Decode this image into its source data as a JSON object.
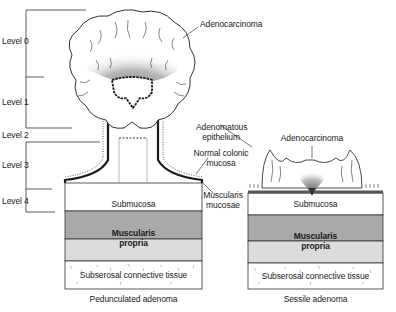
{
  "levels": [
    {
      "label": "Level 0"
    },
    {
      "label": "Level 1"
    },
    {
      "label": "Level 2"
    },
    {
      "label": "Level 3"
    },
    {
      "label": "Level 4"
    }
  ],
  "pedunculated": {
    "caption": "Pedunculated adenoma",
    "annotations": {
      "adenocarcinoma": "Adenocarcinoma",
      "adenomatous_epithelium": [
        "Adenomatous",
        "epithelium"
      ],
      "normal_colonic_mucosa": [
        "Normal colonic",
        "mucosa"
      ],
      "muscularis_mucosae": [
        "Muscularis",
        "mucosae"
      ]
    },
    "layers": {
      "submucosa": "Submucosa",
      "muscularis_propria": [
        "Muscularis",
        "propria"
      ],
      "subserosal": "Subserosal connective tissue"
    }
  },
  "sessile": {
    "caption": "Sessile adenoma",
    "annotations": {
      "adenocarcinoma": "Adenocarcinoma"
    },
    "layers": {
      "submucosa": "Submucosa",
      "muscularis_propria": [
        "Muscularis",
        "propria"
      ],
      "subserosal": "Subserosal connective tissue"
    }
  },
  "colors": {
    "muscularis_dark": "#a9a9a9",
    "muscularis_light": "#dcdcdc",
    "tumor_shade": "#8c8c8c",
    "outline": "#1a1a1a"
  }
}
